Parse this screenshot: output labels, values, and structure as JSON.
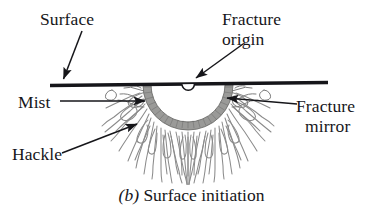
{
  "figure": {
    "kind": "fractography-schematic",
    "caption_index": "(b)",
    "caption_text": " Surface initiation",
    "background_color": "#ffffff",
    "ink_color": "#16161a",
    "mirror_band_color": "#9a9a98",
    "hackle_color": "#8b8b8b"
  },
  "labels": {
    "surface": "Surface",
    "fracture_origin_line1": "Fracture",
    "fracture_origin_line2": "origin",
    "mist": "Mist",
    "hackle": "Hackle",
    "fracture_mirror_line1": "Fracture",
    "fracture_mirror_line2": "mirror"
  },
  "annotations": {
    "surface_leader": "arrow pointing down-left to the specimen surface line",
    "origin_leader": "arrow pointing down-left to the small semicircular origin notch on the surface",
    "mist_leader": "arrow pointing right to the mist zone at the mirror boundary",
    "hackle_leader": "arrow pointing up-right into the radiating hackle lines",
    "mirror_leader": "arrow pointing left to the fracture mirror band"
  },
  "geometry": {
    "surface_line_x_start": 50,
    "surface_line_x_end": 328,
    "surface_line_y": 84,
    "mirror_center_x": 188,
    "mirror_center_y": 85,
    "mirror_outer_radius": 45,
    "mirror_inner_radius": 37,
    "hackle_outer_radius": 80
  }
}
